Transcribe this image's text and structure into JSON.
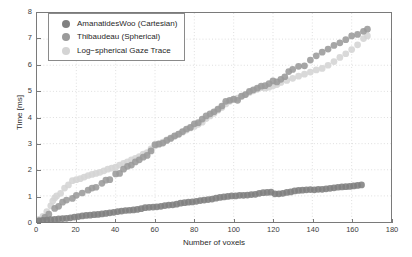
{
  "chart_data": {
    "type": "scatter",
    "title": "",
    "xlabel": "Number of voxels",
    "ylabel": "Time [ms]",
    "xlim": [
      0,
      180
    ],
    "ylim": [
      0,
      8
    ],
    "xticks": [
      0,
      20,
      40,
      60,
      80,
      100,
      120,
      140,
      160,
      180
    ],
    "yticks": [
      0,
      1,
      2,
      3,
      4,
      5,
      6,
      7,
      8
    ],
    "grid": true,
    "legend_position": "upper-left",
    "series": [
      {
        "name": "AmanatidesWoo (Cartesian)",
        "color": "#808080",
        "points": [
          [
            1,
            0.04
          ],
          [
            3,
            0.06
          ],
          [
            5,
            0.07
          ],
          [
            7,
            0.09
          ],
          [
            9,
            0.1
          ],
          [
            11,
            0.12
          ],
          [
            13,
            0.13
          ],
          [
            15,
            0.14
          ],
          [
            17,
            0.16
          ],
          [
            19,
            0.19
          ],
          [
            21,
            0.21
          ],
          [
            23,
            0.23
          ],
          [
            25,
            0.25
          ],
          [
            27,
            0.26
          ],
          [
            29,
            0.28
          ],
          [
            31,
            0.29
          ],
          [
            33,
            0.31
          ],
          [
            35,
            0.33
          ],
          [
            37,
            0.35
          ],
          [
            39,
            0.37
          ],
          [
            41,
            0.4
          ],
          [
            43,
            0.42
          ],
          [
            45,
            0.44
          ],
          [
            47,
            0.45
          ],
          [
            49,
            0.46
          ],
          [
            51,
            0.48
          ],
          [
            53,
            0.51
          ],
          [
            55,
            0.55
          ],
          [
            57,
            0.56
          ],
          [
            59,
            0.57
          ],
          [
            61,
            0.58
          ],
          [
            63,
            0.6
          ],
          [
            65,
            0.63
          ],
          [
            67,
            0.65
          ],
          [
            69,
            0.66
          ],
          [
            71,
            0.68
          ],
          [
            73,
            0.72
          ],
          [
            75,
            0.74
          ],
          [
            77,
            0.76
          ],
          [
            79,
            0.77
          ],
          [
            81,
            0.79
          ],
          [
            83,
            0.82
          ],
          [
            85,
            0.84
          ],
          [
            87,
            0.86
          ],
          [
            89,
            0.88
          ],
          [
            91,
            0.91
          ],
          [
            93,
            0.94
          ],
          [
            95,
            0.96
          ],
          [
            97,
            0.98
          ],
          [
            99,
            1.0
          ],
          [
            101,
            1.0
          ],
          [
            103,
            1.02
          ],
          [
            105,
            1.02
          ],
          [
            107,
            1.03
          ],
          [
            109,
            1.05
          ],
          [
            111,
            1.06
          ],
          [
            113,
            1.1
          ],
          [
            115,
            1.12
          ],
          [
            117,
            1.13
          ],
          [
            119,
            1.14
          ],
          [
            121,
            1.08
          ],
          [
            123,
            1.08
          ],
          [
            125,
            1.1
          ],
          [
            127,
            1.13
          ],
          [
            129,
            1.15
          ],
          [
            131,
            1.19
          ],
          [
            133,
            1.21
          ],
          [
            135,
            1.22
          ],
          [
            137,
            1.23
          ],
          [
            139,
            1.24
          ],
          [
            141,
            1.23
          ],
          [
            143,
            1.25
          ],
          [
            145,
            1.25
          ],
          [
            147,
            1.27
          ],
          [
            149,
            1.29
          ],
          [
            151,
            1.31
          ],
          [
            153,
            1.33
          ],
          [
            155,
            1.34
          ],
          [
            157,
            1.35
          ],
          [
            159,
            1.36
          ],
          [
            161,
            1.38
          ],
          [
            163,
            1.4
          ],
          [
            165,
            1.42
          ]
        ]
      },
      {
        "name": "Thibaudeau (Spherical)",
        "color": "#9a9a9a",
        "points": [
          [
            1,
            0.05
          ],
          [
            4,
            0.18
          ],
          [
            6,
            0.3
          ],
          [
            9,
            0.52
          ],
          [
            11,
            0.6
          ],
          [
            13,
            0.76
          ],
          [
            15,
            0.84
          ],
          [
            18,
            0.9
          ],
          [
            20,
            1.02
          ],
          [
            23,
            1.11
          ],
          [
            26,
            1.22
          ],
          [
            28,
            1.3
          ],
          [
            30,
            1.33
          ],
          [
            33,
            1.48
          ],
          [
            35,
            1.6
          ],
          [
            37,
            1.62
          ],
          [
            40,
            1.84
          ],
          [
            42,
            1.86
          ],
          [
            44,
            2.02
          ],
          [
            46,
            2.13
          ],
          [
            48,
            2.18
          ],
          [
            50,
            2.3
          ],
          [
            52,
            2.38
          ],
          [
            54,
            2.48
          ],
          [
            56,
            2.55
          ],
          [
            58,
            2.72
          ],
          [
            60,
            2.96
          ],
          [
            62,
            2.98
          ],
          [
            64,
            3.02
          ],
          [
            66,
            3.12
          ],
          [
            68,
            3.2
          ],
          [
            70,
            3.3
          ],
          [
            72,
            3.36
          ],
          [
            74,
            3.46
          ],
          [
            76,
            3.56
          ],
          [
            78,
            3.62
          ],
          [
            80,
            3.76
          ],
          [
            82,
            3.8
          ],
          [
            84,
            3.94
          ],
          [
            86,
            4.06
          ],
          [
            88,
            4.14
          ],
          [
            90,
            4.22
          ],
          [
            92,
            4.32
          ],
          [
            94,
            4.44
          ],
          [
            96,
            4.62
          ],
          [
            98,
            4.66
          ],
          [
            100,
            4.7
          ],
          [
            102,
            4.66
          ],
          [
            104,
            4.82
          ],
          [
            106,
            4.88
          ],
          [
            108,
            5.0
          ],
          [
            110,
            5.06
          ],
          [
            112,
            5.12
          ],
          [
            114,
            5.2
          ],
          [
            116,
            5.22
          ],
          [
            118,
            5.3
          ],
          [
            120,
            5.4
          ],
          [
            122,
            5.36
          ],
          [
            124,
            5.46
          ],
          [
            126,
            5.56
          ],
          [
            128,
            5.76
          ],
          [
            130,
            5.84
          ],
          [
            133,
            5.96
          ],
          [
            136,
            5.98
          ],
          [
            139,
            6.2
          ],
          [
            142,
            6.36
          ],
          [
            145,
            6.5
          ],
          [
            148,
            6.62
          ],
          [
            151,
            6.76
          ],
          [
            154,
            6.86
          ],
          [
            157,
            6.98
          ],
          [
            160,
            7.12
          ],
          [
            163,
            7.18
          ],
          [
            166,
            7.3
          ],
          [
            168,
            7.38
          ]
        ]
      },
      {
        "name": "Log−spherical Gaze Trace",
        "color": "#d4d4d4",
        "points": [
          [
            1,
            0.1
          ],
          [
            3,
            0.22
          ],
          [
            5,
            0.4
          ],
          [
            7,
            0.62
          ],
          [
            8,
            0.8
          ],
          [
            9,
            0.92
          ],
          [
            10,
            1.0
          ],
          [
            12,
            1.1
          ],
          [
            14,
            1.3
          ],
          [
            16,
            1.42
          ],
          [
            18,
            1.58
          ],
          [
            20,
            1.62
          ],
          [
            22,
            1.66
          ],
          [
            24,
            1.72
          ],
          [
            26,
            1.78
          ],
          [
            28,
            1.82
          ],
          [
            30,
            1.86
          ],
          [
            32,
            1.9
          ],
          [
            34,
            1.96
          ],
          [
            36,
            2.02
          ],
          [
            38,
            2.06
          ],
          [
            40,
            2.1
          ],
          [
            42,
            2.18
          ],
          [
            44,
            2.24
          ],
          [
            46,
            2.3
          ],
          [
            48,
            2.38
          ],
          [
            50,
            2.44
          ],
          [
            52,
            2.5
          ],
          [
            54,
            2.6
          ],
          [
            56,
            2.66
          ],
          [
            58,
            2.8
          ],
          [
            60,
            2.92
          ],
          [
            62,
            3.0
          ],
          [
            64,
            3.06
          ],
          [
            66,
            3.14
          ],
          [
            68,
            3.22
          ],
          [
            70,
            3.28
          ],
          [
            72,
            3.36
          ],
          [
            74,
            3.44
          ],
          [
            76,
            3.52
          ],
          [
            78,
            3.6
          ],
          [
            80,
            3.66
          ],
          [
            82,
            3.74
          ],
          [
            84,
            3.82
          ],
          [
            86,
            3.96
          ],
          [
            88,
            4.06
          ],
          [
            90,
            4.16
          ],
          [
            92,
            4.28
          ],
          [
            94,
            4.38
          ],
          [
            96,
            4.52
          ],
          [
            98,
            4.62
          ],
          [
            100,
            4.68
          ],
          [
            102,
            4.74
          ],
          [
            104,
            4.8
          ],
          [
            106,
            4.88
          ],
          [
            108,
            4.96
          ],
          [
            110,
            5.02
          ],
          [
            112,
            5.08
          ],
          [
            114,
            5.14
          ],
          [
            116,
            5.12
          ],
          [
            118,
            5.16
          ],
          [
            120,
            5.22
          ],
          [
            122,
            5.26
          ],
          [
            124,
            5.34
          ],
          [
            127,
            5.42
          ],
          [
            130,
            5.5
          ],
          [
            133,
            5.58
          ],
          [
            136,
            5.66
          ],
          [
            139,
            5.74
          ],
          [
            142,
            5.82
          ],
          [
            145,
            5.88
          ],
          [
            148,
            6.0
          ],
          [
            151,
            6.14
          ],
          [
            154,
            6.3
          ],
          [
            157,
            6.44
          ],
          [
            160,
            6.6
          ],
          [
            163,
            6.78
          ],
          [
            166,
            7.02
          ],
          [
            168,
            7.12
          ]
        ]
      }
    ]
  },
  "legend": {
    "entries": [
      {
        "label": "AmanatidesWoo (Cartesian)",
        "color": "#808080"
      },
      {
        "label": "Thibaudeau (Spherical)",
        "color": "#9a9a9a"
      },
      {
        "label": "Log−spherical Gaze Trace",
        "color": "#d4d4d4"
      }
    ]
  }
}
